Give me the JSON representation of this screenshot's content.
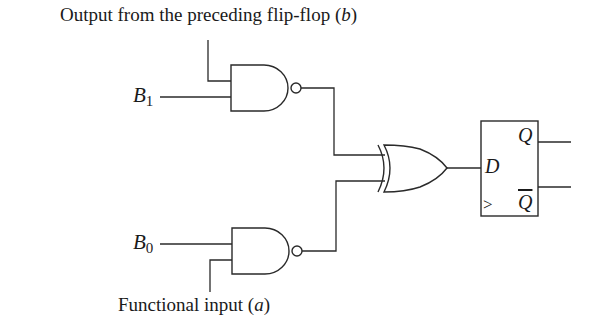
{
  "diagram": {
    "type": "logic-circuit",
    "colors": {
      "stroke": "#2a2a2a",
      "background": "#ffffff",
      "text": "#1a1a1a"
    },
    "labels": {
      "top_input": {
        "text": "Output from the preceding flip-flop (",
        "var": "b",
        "close": ")"
      },
      "bottom_input": {
        "text": "Functional input (",
        "var": "a",
        "close": ")"
      },
      "b1": {
        "base": "B",
        "sub": "1"
      },
      "b0": {
        "base": "B",
        "sub": "0"
      }
    },
    "components": [
      {
        "id": "nand-upper",
        "type": "NAND",
        "inputs": [
          "b (preceding flip-flop output)",
          "B1"
        ]
      },
      {
        "id": "nand-lower",
        "type": "NAND",
        "inputs": [
          "B0",
          "a (functional input)"
        ]
      },
      {
        "id": "xor",
        "type": "XOR",
        "inputs": [
          "nand-upper",
          "nand-lower"
        ]
      },
      {
        "id": "dff",
        "type": "D flip-flop",
        "pins": {
          "d": "D",
          "clock": ">",
          "q": "Q",
          "qbar": "Q"
        }
      }
    ]
  }
}
